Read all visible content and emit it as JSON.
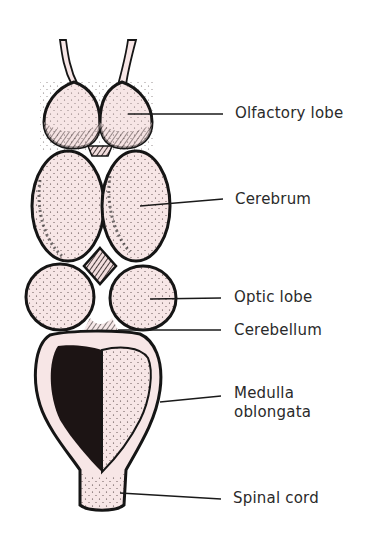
{
  "figure": {
    "fill_color": "#f7e6e6",
    "outline_color": "#151515",
    "labels": [
      {
        "id": "olfactory",
        "text": "Olfactory lobe"
      },
      {
        "id": "cerebrum",
        "text": "Cerebrum"
      },
      {
        "id": "optic",
        "text": "Optic lobe"
      },
      {
        "id": "cerebellum",
        "text": "Cerebellum"
      },
      {
        "id": "medulla_1",
        "text": "Medulla"
      },
      {
        "id": "medulla_2",
        "text": "oblongata"
      },
      {
        "id": "spinal",
        "text": "Spinal cord"
      }
    ]
  }
}
